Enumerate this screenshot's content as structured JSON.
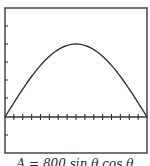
{
  "chart_data": {
    "type": "line",
    "title": "",
    "caption": "A = 800 sin θ cos θ",
    "caption_note": "Caption is cut off at the bottom edge of the image; this reading is an inference from partially visible glyphs and the curve shape, not confirmed",
    "xlabel": "",
    "ylabel": "",
    "x_tick_count": 16,
    "y_ticks_above_axis": 5,
    "y_ticks_below_axis": 1,
    "grid": false,
    "legend": null,
    "series": [
      {
        "name": "curve",
        "shape": "single hump, zero at both ends of the x-range, maximum at the center",
        "relative_points": [
          [
            0.0,
            0.0
          ],
          [
            0.1,
            0.31
          ],
          [
            0.2,
            0.59
          ],
          [
            0.3,
            0.81
          ],
          [
            0.4,
            0.95
          ],
          [
            0.5,
            1.0
          ],
          [
            0.6,
            0.95
          ],
          [
            0.7,
            0.81
          ],
          [
            0.8,
            0.59
          ],
          [
            0.9,
            0.31
          ],
          [
            1.0,
            0.0
          ]
        ]
      }
    ]
  },
  "colors": {
    "frame": "#3a3a3a",
    "curve": "#333333",
    "background": "#ffffff"
  },
  "caption": "A = 800 sin θ cos θ"
}
